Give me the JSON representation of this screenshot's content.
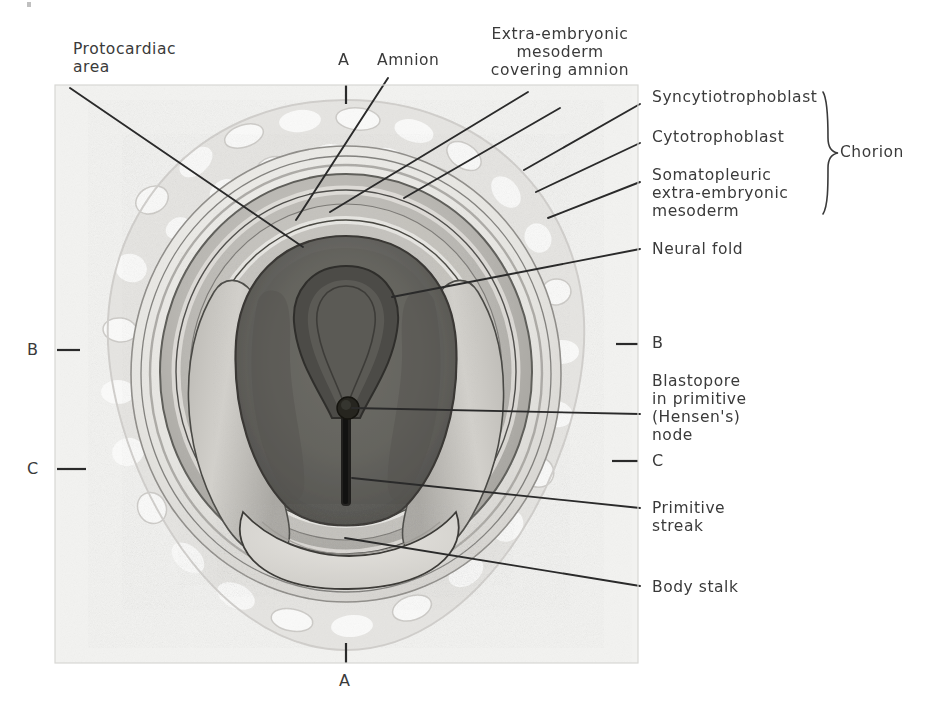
{
  "figure": {
    "kind": "anatomical-illustration",
    "plate": {
      "left": 55,
      "top": 85,
      "width": 583,
      "height": 578
    }
  },
  "labels": {
    "protocardiac_area": "Protocardiac\narea",
    "section_a_top": "A",
    "amnion": "Amnion",
    "extra_embryonic_mesoderm": "Extra-embryonic\nmesoderm\ncovering amnion",
    "syncytiotrophoblast": "Syncytiotrophoblast",
    "cytotrophoblast": "Cytotrophoblast",
    "somatopleuric": "Somatopleuric\nextra-embryonic\nmesoderm",
    "chorion": "Chorion",
    "neural_fold": "Neural fold",
    "section_b_right": "B",
    "blastopore": "Blastopore\nin primitive\n(Hensen's)\nnode",
    "section_c_right": "C",
    "primitive_streak": "Primitive\nstreak",
    "body_stalk": "Body stalk",
    "section_b_left": "B",
    "section_c_left": "C",
    "section_a_bottom": "A"
  },
  "colors": {
    "paper": "#ffffff",
    "plate_bg": "#f4f4f2",
    "ink": "#3a3a3a",
    "leader": "#2a2a2a",
    "villi_light": "#e9e9e7",
    "villi_mid": "#d9d9d6",
    "chorion_ring": "#f0efec",
    "amnion_band": "#c9c8c4",
    "yolk_ring": "#b2b0ac",
    "embryonic_disc": "#6d6c69",
    "embryonic_disc_dark": "#585754",
    "neural_groove": "#3f3e3c",
    "streak_dark": "#232321",
    "body_stalk": "#dedcd8"
  }
}
